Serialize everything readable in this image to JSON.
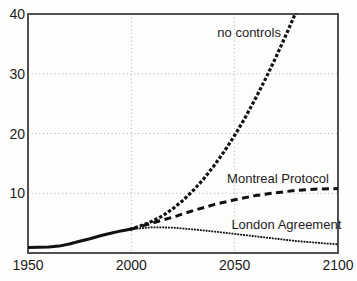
{
  "figure": {
    "background": "#fdfdfc",
    "border_color": "#3f3f3f",
    "line_color": "#111111",
    "grid_color": "#a8a8a8",
    "text_color": "#1c1c1c"
  },
  "chart_data": {
    "type": "line",
    "title": "",
    "xlabel": "",
    "ylabel": "",
    "xlim": [
      1950,
      2100
    ],
    "ylim": [
      0,
      40
    ],
    "x_ticks": [
      "1950",
      "2000",
      "2050",
      "2100"
    ],
    "x_tick_values": [
      1950,
      2000,
      2050,
      2100
    ],
    "y_ticks": [
      "10",
      "20",
      "30",
      "40"
    ],
    "y_tick_values": [
      10,
      20,
      30,
      40
    ],
    "grid": {
      "on": true,
      "horizontal": [
        10,
        20,
        30
      ],
      "vertical": [
        2000,
        2050
      ]
    },
    "legend": "inline-annotations",
    "series": [
      {
        "name": "historical",
        "style": "solid",
        "x": [
          1950,
          1955,
          1960,
          1965,
          1970,
          1975,
          1980,
          1985,
          1990,
          1995,
          2000
        ],
        "y": [
          0.9,
          0.95,
          1.0,
          1.15,
          1.5,
          1.95,
          2.4,
          2.9,
          3.3,
          3.7,
          4.0
        ]
      },
      {
        "name": "no controls",
        "style": "bold-dotted",
        "x": [
          2000,
          2005,
          2010,
          2015,
          2020,
          2025,
          2030,
          2035,
          2040,
          2045,
          2050,
          2055,
          2060,
          2065,
          2070,
          2075,
          2080
        ],
        "y": [
          4.0,
          4.6,
          5.3,
          6.2,
          7.4,
          8.8,
          10.5,
          12.4,
          14.6,
          17.0,
          19.7,
          22.6,
          25.8,
          29.2,
          32.8,
          36.6,
          40.6
        ]
      },
      {
        "name": "Montreal Protocol",
        "style": "dashed",
        "x": [
          2000,
          2010,
          2020,
          2030,
          2040,
          2050,
          2060,
          2070,
          2080,
          2090,
          2100
        ],
        "y": [
          4.0,
          5.0,
          6.0,
          7.1,
          8.1,
          8.9,
          9.6,
          10.1,
          10.5,
          10.7,
          10.8
        ]
      },
      {
        "name": "London Agreement",
        "style": "fine-dotted",
        "x": [
          2000,
          2010,
          2020,
          2030,
          2040,
          2050,
          2060,
          2070,
          2080,
          2090,
          2100
        ],
        "y": [
          4.0,
          4.3,
          4.25,
          3.95,
          3.6,
          3.2,
          2.8,
          2.4,
          2.0,
          1.7,
          1.45
        ]
      }
    ],
    "annotations": [
      {
        "label": "no controls",
        "x": 2057,
        "y": 36.2
      },
      {
        "label": "Montreal Protocol",
        "x": 2071,
        "y": 11.7
      },
      {
        "label": "London Agreement",
        "x": 2075,
        "y": 4.0
      }
    ]
  }
}
